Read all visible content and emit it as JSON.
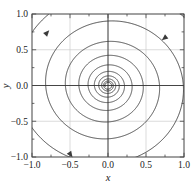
{
  "figure": {
    "background": "#ffffff",
    "frame_color": "#555555",
    "grid_color": "#cccccc",
    "axis_line_color": "#333333",
    "curve_color": "#3a3a3a"
  },
  "chart_data": {
    "type": "line",
    "title": "",
    "subtitle": "",
    "xlabel": "x",
    "ylabel": "y",
    "xlim": [
      -1.0,
      1.0
    ],
    "ylim": [
      -1.0,
      1.0
    ],
    "xticks": [
      -1.0,
      -0.5,
      0.0,
      0.5,
      1.0
    ],
    "yticks": [
      -1.0,
      -0.5,
      0.0,
      0.5,
      1.0
    ],
    "xticklabels": [
      "-1.0",
      "-0.5",
      "0.0",
      "0.5",
      "1.0"
    ],
    "yticklabels": [
      "-1.0",
      "-0.5",
      "0.0",
      "0.5",
      "1.0"
    ],
    "minor_tick_step": 0.25,
    "grid": true,
    "grid_step": 0.5,
    "legend": "none",
    "series": [
      {
        "name": "spiral-trajectory",
        "kind": "logarithmic-spiral",
        "r0": 1.45,
        "decay_b": 0.0605,
        "theta_start": 0.0,
        "theta_end": 60.2,
        "direction": "inward-clockwise",
        "color": "#3a3a3a",
        "linewidth": 0.9
      }
    ],
    "annotations": [
      {
        "name": "arrow-upper-left",
        "x": -0.8,
        "y": 0.74,
        "angle_deg": 48,
        "note": "flow direction marker"
      },
      {
        "name": "arrow-upper-right",
        "x": 0.74,
        "y": 0.66,
        "angle_deg": 218,
        "note": "flow direction marker"
      },
      {
        "name": "arrow-lower-left",
        "x": -0.49,
        "y": -0.97,
        "angle_deg": 305,
        "note": "flow direction marker"
      }
    ],
    "fixed_points": [
      {
        "name": "origin",
        "x": 0.0,
        "y": 0.0,
        "type": "stable-spiral"
      }
    ]
  }
}
